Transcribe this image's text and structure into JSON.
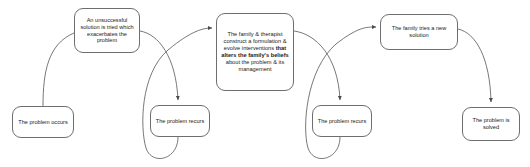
{
  "diagram": {
    "type": "flowchart",
    "background_color": "#ffffff",
    "node_border_color": "#6e6e6e",
    "edge_color": "#555555",
    "text_color": "#1a1a1a",
    "nodes": [
      {
        "id": "problem-occurs",
        "label": "The problem occurs",
        "lines": [
          "The problem",
          "occurs"
        ]
      },
      {
        "id": "unsuccessful-solution",
        "label": "An unsuccessful solution is tried which exacerbates the problem",
        "lines": [
          "An unsuccessful",
          "solution",
          "is tried which",
          "exacerbates the",
          "problem"
        ]
      },
      {
        "id": "problem-recurs-1",
        "label": "The problem recurs",
        "lines": [
          "The problem",
          "recurs"
        ]
      },
      {
        "id": "family-therapist",
        "label": "The family & therapist construct a formulation & evolve interventions that alters the family's beliefs about the problem & its management",
        "segments": [
          {
            "text": "The family & therapist construct a formulation & evolve interventions ",
            "bold": false
          },
          {
            "text": "that alters the family's beliefs",
            "bold": true
          },
          {
            "text": " about the problem & its management",
            "bold": false
          }
        ]
      },
      {
        "id": "problem-recurs-2",
        "label": "The problem recurs",
        "lines": [
          "The problem",
          "recurs"
        ]
      },
      {
        "id": "family-new-solution",
        "label": "The family tries a new solution",
        "lines": [
          "The family tries a",
          "new solution"
        ]
      },
      {
        "id": "problem-solved",
        "label": "The problem is solved",
        "lines": [
          "The problem",
          "is solved"
        ]
      }
    ],
    "edges": [
      {
        "from": "problem-occurs",
        "to": "unsuccessful-solution",
        "arrowhead": false
      },
      {
        "from": "unsuccessful-solution",
        "to": "problem-recurs-1",
        "arrowhead": true
      },
      {
        "from": "problem-recurs-1",
        "to": "family-therapist",
        "arrowhead": true
      },
      {
        "from": "family-therapist",
        "to": "problem-recurs-2",
        "arrowhead": true
      },
      {
        "from": "problem-recurs-2",
        "to": "family-new-solution",
        "arrowhead": true
      },
      {
        "from": "family-new-solution",
        "to": "problem-solved",
        "arrowhead": true
      }
    ]
  }
}
